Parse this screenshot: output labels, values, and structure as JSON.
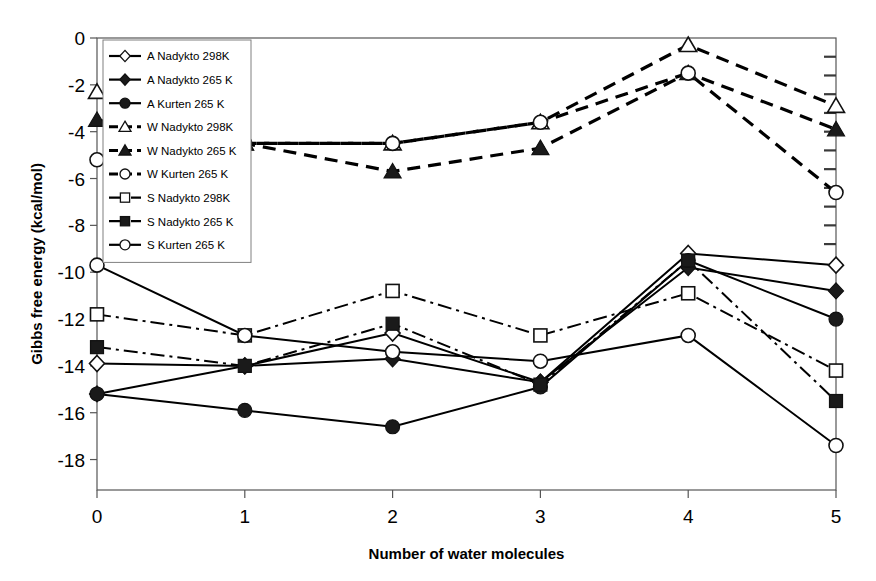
{
  "chart_data": {
    "type": "line",
    "title": "",
    "xlabel": "Number of water molecules",
    "ylabel": "Gibbs free energy (kcal/mol)",
    "x": [
      0,
      1,
      2,
      3,
      4,
      5
    ],
    "xticklabels": [
      "0",
      "1",
      "2",
      "3",
      "4",
      "5"
    ],
    "yticklabels": [
      "0",
      "-2",
      "-4",
      "-6",
      "-8",
      "-10",
      "-12",
      "-14",
      "-16",
      "-18"
    ],
    "xlim": [
      0,
      5
    ],
    "ylim": [
      -19.3,
      0
    ],
    "yticks": [
      0,
      -2,
      -4,
      -6,
      -8,
      -10,
      -12,
      -14,
      -16,
      -18
    ],
    "grid": false,
    "legend_position": "upper-left-inside",
    "series": [
      {
        "name": "A  Nadykto 298K",
        "key": "a-nadykto-298k",
        "marker": "open-diamond",
        "linestyle": "solid",
        "values": [
          -13.9,
          -14.0,
          -12.6,
          -14.7,
          -9.2,
          -9.7
        ]
      },
      {
        "name": "A  Nadykto 265 K",
        "key": "a-nadykto-265k",
        "marker": "filled-diamond",
        "linestyle": "solid",
        "values": [
          -15.2,
          -14.0,
          -13.7,
          -14.7,
          -9.8,
          -10.8
        ]
      },
      {
        "name": "A  Kurten  265 K",
        "key": "a-kurten-265k",
        "marker": "filled-circle",
        "linestyle": "solid",
        "values": [
          -15.2,
          -15.9,
          -16.6,
          -14.9,
          -9.5,
          -12.0
        ]
      },
      {
        "name": "W  Nadykto  298K",
        "key": "w-nadykto-298k",
        "marker": "open-triangle",
        "linestyle": "dashed",
        "values": [
          -2.3,
          -4.5,
          -4.5,
          -3.6,
          -0.3,
          -2.9
        ]
      },
      {
        "name": "W  Nadykto 265 K",
        "key": "w-nadykto-265k",
        "marker": "filled-triangle",
        "linestyle": "dashed",
        "values": [
          -3.5,
          -4.5,
          -5.7,
          -4.7,
          -1.5,
          -3.9
        ]
      },
      {
        "name": "W  Kurten 265 K",
        "key": "w-kurten-265k",
        "marker": "open-circle",
        "linestyle": "dashed",
        "values": [
          -5.2,
          -4.5,
          -4.5,
          -3.6,
          -1.5,
          -6.6
        ]
      },
      {
        "name": "S  Nadykto 298K",
        "key": "s-nadykto-298k",
        "marker": "open-square",
        "linestyle": "dashdot",
        "values": [
          -11.8,
          -12.7,
          -10.8,
          -12.7,
          -10.9,
          -14.2
        ]
      },
      {
        "name": "S  Nadykto 265 K",
        "key": "s-nadykto-265k",
        "marker": "filled-square",
        "linestyle": "dashdot",
        "values": [
          -13.2,
          -14.0,
          -12.2,
          -14.8,
          -9.5,
          -15.5
        ]
      },
      {
        "name": "S  Kurten 265 K",
        "key": "s-kurten-265k",
        "marker": "open-circle",
        "linestyle": "solid",
        "values": [
          -9.7,
          -12.7,
          -13.4,
          -13.8,
          -12.7,
          -17.4
        ]
      }
    ]
  },
  "colors": {
    "line": "#000000",
    "marker_fill_open": "#ffffff",
    "marker_fill_closed": "#1a1a1a",
    "axis": "#555555",
    "legend_border": "#808080"
  }
}
